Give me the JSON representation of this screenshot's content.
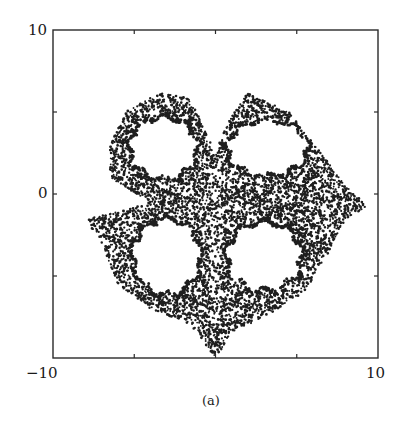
{
  "figure": {
    "caption": "(a)",
    "frame_color": "#2a2a2a",
    "ink_color": "#1e1e1e"
  },
  "chart_data": {
    "type": "scatter",
    "title": "",
    "subtitle": "",
    "xlabel": "",
    "ylabel": "",
    "xlim": [
      -10,
      10
    ],
    "ylim": [
      -10,
      10
    ],
    "x_tick_labels": [
      "-10",
      "10"
    ],
    "y_tick_labels": [
      "10",
      "0"
    ],
    "x_ticks": [
      -10,
      -5,
      0,
      5,
      10
    ],
    "y_ticks": [
      -10,
      -5,
      0,
      5,
      10
    ],
    "grid": false,
    "legend": null,
    "caption": "(a)",
    "series": [
      {
        "name": "attractor",
        "shape_outline_approx": [
          [
            -6.5,
            3.0
          ],
          [
            -5.5,
            5.0
          ],
          [
            -3.5,
            6.2
          ],
          [
            -1.5,
            5.8
          ],
          [
            -0.5,
            3.5
          ],
          [
            0.0,
            2.5
          ],
          [
            0.8,
            4.5
          ],
          [
            2.0,
            6.2
          ],
          [
            4.5,
            5.0
          ],
          [
            6.5,
            2.5
          ],
          [
            8.0,
            0.5
          ],
          [
            9.4,
            -0.8
          ],
          [
            8.0,
            -1.5
          ],
          [
            7.0,
            -3.5
          ],
          [
            5.5,
            -6.0
          ],
          [
            3.0,
            -7.5
          ],
          [
            1.0,
            -8.5
          ],
          [
            0.0,
            -10.0
          ],
          [
            -1.5,
            -8.0
          ],
          [
            -4.0,
            -7.0
          ],
          [
            -6.0,
            -5.5
          ],
          [
            -7.0,
            -3.0
          ],
          [
            -8.0,
            -1.5
          ],
          [
            -5.5,
            -1.0
          ],
          [
            -4.0,
            -0.5
          ],
          [
            -6.5,
            1.0
          ],
          [
            -6.5,
            3.0
          ]
        ],
        "holes_approx": [
          {
            "name": "upper-left-lobe",
            "center": [
              -3.2,
              2.8
            ],
            "rx": 2.0,
            "ry": 1.8
          },
          {
            "name": "upper-right-lobe",
            "center": [
              3.2,
              2.8
            ],
            "rx": 2.4,
            "ry": 1.6
          },
          {
            "name": "lower-left-lobe",
            "center": [
              -3.0,
              -3.8
            ],
            "rx": 2.0,
            "ry": 2.2
          },
          {
            "name": "lower-right-lobe",
            "center": [
              3.0,
              -3.8
            ],
            "rx": 2.2,
            "ry": 2.0
          }
        ]
      }
    ]
  }
}
